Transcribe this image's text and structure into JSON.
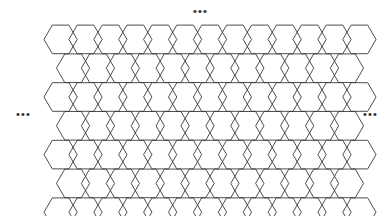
{
  "figure": {
    "type": "hexagonal-lattice-diagram",
    "title": "",
    "background_color": "#ffffff",
    "stroke_color": "#3a3a3a",
    "stroke_width": 0.9
  },
  "lattice": {
    "name": "honeycomb-hexagonal-lattice",
    "orientation": "flat-top",
    "hex_radius": 16.6,
    "column_spacing": 24.9,
    "row_spacing": 28.8,
    "origin_x": 60.6,
    "origin_y": 39.4,
    "columns": 12,
    "rows": 7,
    "offset_rows": true,
    "fill": "none"
  },
  "annotations": {
    "top_ellipsis": "•••",
    "left_ellipsis": "•••",
    "right_ellipsis": "•••"
  },
  "chart_data": {
    "type": "diagram",
    "title": "",
    "xlabel": "",
    "ylabel": "",
    "cell_shape": "regular hexagon",
    "cell_count_visible": 84,
    "rows_visible": 7,
    "columns_visible": 12,
    "grid": false,
    "legend": "none"
  }
}
